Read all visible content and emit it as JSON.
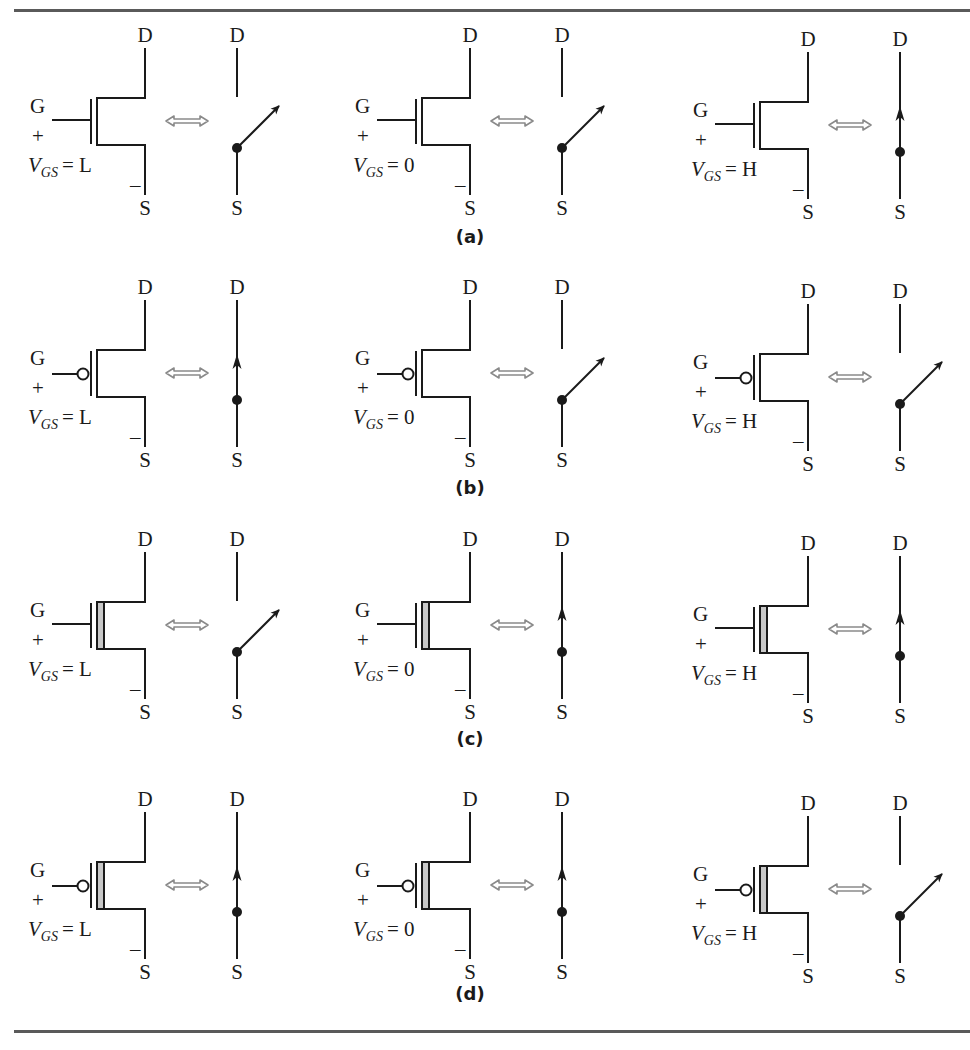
{
  "figure": {
    "rows": [
      {
        "caption": "(a)",
        "device": "enhancement-nmos",
        "cells": [
          {
            "gate": "G",
            "plus": "+",
            "minus": "–",
            "drain": "D",
            "source": "S",
            "vgs_prefix": "V",
            "vgs_sub": "GS",
            "vgs_value": "= L",
            "switch_state": "open",
            "switch_drain": "D",
            "switch_source": "S"
          },
          {
            "gate": "G",
            "plus": "+",
            "minus": "–",
            "drain": "D",
            "source": "S",
            "vgs_prefix": "V",
            "vgs_sub": "GS",
            "vgs_value": "= 0",
            "switch_state": "open",
            "switch_drain": "D",
            "switch_source": "S"
          },
          {
            "gate": "G",
            "plus": "+",
            "minus": "–",
            "drain": "D",
            "source": "S",
            "vgs_prefix": "V",
            "vgs_sub": "GS",
            "vgs_value": "= H",
            "switch_state": "closed",
            "switch_drain": "D",
            "switch_source": "S"
          }
        ]
      },
      {
        "caption": "(b)",
        "device": "enhancement-pmos",
        "cells": [
          {
            "gate": "G",
            "plus": "+",
            "minus": "–",
            "drain": "D",
            "source": "S",
            "vgs_prefix": "V",
            "vgs_sub": "GS",
            "vgs_value": "= L",
            "switch_state": "closed",
            "switch_drain": "D",
            "switch_source": "S"
          },
          {
            "gate": "G",
            "plus": "+",
            "minus": "–",
            "drain": "D",
            "source": "S",
            "vgs_prefix": "V",
            "vgs_sub": "GS",
            "vgs_value": "= 0",
            "switch_state": "open",
            "switch_drain": "D",
            "switch_source": "S"
          },
          {
            "gate": "G",
            "plus": "+",
            "minus": "–",
            "drain": "D",
            "source": "S",
            "vgs_prefix": "V",
            "vgs_sub": "GS",
            "vgs_value": "= H",
            "switch_state": "open",
            "switch_drain": "D",
            "switch_source": "S"
          }
        ]
      },
      {
        "caption": "(c)",
        "device": "depletion-nmos",
        "cells": [
          {
            "gate": "G",
            "plus": "+",
            "minus": "–",
            "drain": "D",
            "source": "S",
            "vgs_prefix": "V",
            "vgs_sub": "GS",
            "vgs_value": "= L",
            "switch_state": "open",
            "switch_drain": "D",
            "switch_source": "S"
          },
          {
            "gate": "G",
            "plus": "+",
            "minus": "–",
            "drain": "D",
            "source": "S",
            "vgs_prefix": "V",
            "vgs_sub": "GS",
            "vgs_value": "= 0",
            "switch_state": "closed",
            "switch_drain": "D",
            "switch_source": "S"
          },
          {
            "gate": "G",
            "plus": "+",
            "minus": "–",
            "drain": "D",
            "source": "S",
            "vgs_prefix": "V",
            "vgs_sub": "GS",
            "vgs_value": "= H",
            "switch_state": "closed",
            "switch_drain": "D",
            "switch_source": "S"
          }
        ]
      },
      {
        "caption": "(d)",
        "device": "depletion-pmos",
        "cells": [
          {
            "gate": "G",
            "plus": "+",
            "minus": "–",
            "drain": "D",
            "source": "S",
            "vgs_prefix": "V",
            "vgs_sub": "GS",
            "vgs_value": "= L",
            "switch_state": "closed",
            "switch_drain": "D",
            "switch_source": "S"
          },
          {
            "gate": "G",
            "plus": "+",
            "minus": "–",
            "drain": "D",
            "source": "S",
            "vgs_prefix": "V",
            "vgs_sub": "GS",
            "vgs_value": "= 0",
            "switch_state": "closed",
            "switch_drain": "D",
            "switch_source": "S"
          },
          {
            "gate": "G",
            "plus": "+",
            "minus": "–",
            "drain": "D",
            "source": "S",
            "vgs_prefix": "V",
            "vgs_sub": "GS",
            "vgs_value": "= H",
            "switch_state": "open",
            "switch_drain": "D",
            "switch_source": "S"
          }
        ]
      }
    ],
    "colors": {
      "ink": "#1a1a1a",
      "rule": "#5a5a5a",
      "equiv_arrow": "#8a8a8a",
      "channel_fill": "#c8c8c8"
    }
  }
}
